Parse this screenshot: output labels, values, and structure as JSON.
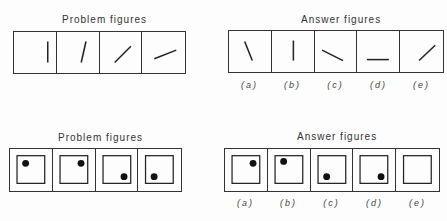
{
  "set1": {
    "problem_title": "Problem figures",
    "answer_title": "Answer figures",
    "problem_figures": [
      {
        "line": [
          35,
          10,
          35,
          32
        ]
      },
      {
        "line": [
          25,
          32,
          30,
          10
        ]
      },
      {
        "line": [
          15,
          32,
          32,
          15
        ]
      },
      {
        "line": [
          12,
          28,
          35,
          19
        ]
      }
    ],
    "answer_figures": [
      {
        "label": "(a)",
        "line": [
          16,
          11,
          24,
          31
        ]
      },
      {
        "label": "(b)",
        "line": [
          22,
          10,
          22,
          31
        ]
      },
      {
        "label": "(c)",
        "line": [
          7,
          20,
          29,
          31
        ]
      },
      {
        "label": "(d)",
        "line": [
          10,
          30,
          33,
          30
        ]
      },
      {
        "label": "(e)",
        "line": [
          19,
          31,
          36,
          15
        ]
      }
    ]
  },
  "set2": {
    "problem_title": "Problem figures",
    "answer_title": "Answer figures",
    "problem_figures": [
      {
        "dot": [
          16,
          15
        ]
      },
      {
        "dot": [
          29,
          15
        ]
      },
      {
        "dot": [
          29,
          29
        ]
      },
      {
        "dot": [
          16,
          29
        ]
      }
    ],
    "answer_figures": [
      {
        "label": "(a)",
        "dot": [
          29,
          15
        ]
      },
      {
        "label": "(b)",
        "dot": [
          16,
          13
        ]
      },
      {
        "label": "(c)",
        "dot": [
          16,
          29
        ]
      },
      {
        "label": "(d)",
        "dot": [
          29,
          29
        ]
      },
      {
        "label": "(e)",
        "dot": null
      }
    ]
  }
}
